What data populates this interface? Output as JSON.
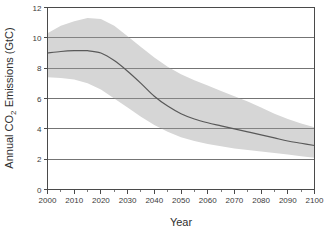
{
  "chart_data": {
    "type": "area",
    "title": "",
    "xlabel": "Year",
    "ylabel": "Annual CO2 Emissions (GtC)",
    "ylabel_parts": {
      "prefix": "Annual CO",
      "subscript": "2",
      "suffix": " Emissions (GtC)"
    },
    "xlim": [
      2000,
      2100
    ],
    "ylim": [
      0,
      12
    ],
    "grid": "horizontal",
    "legend": "none",
    "x_ticks": [
      2000,
      2010,
      2020,
      2030,
      2040,
      2050,
      2060,
      2070,
      2080,
      2090,
      2100
    ],
    "x_tick_labels": [
      "2000",
      "2010",
      "2020",
      "2030",
      "2040",
      "2050",
      "2060",
      "2070",
      "2080",
      "2090",
      "2100"
    ],
    "x_minor_tick_interval": 5,
    "y_ticks": [
      0,
      2,
      4,
      6,
      8,
      10,
      12
    ],
    "y_tick_labels": [
      "0",
      "2",
      "4",
      "6",
      "8",
      "10",
      "12"
    ],
    "x": [
      2000,
      2005,
      2010,
      2015,
      2020,
      2025,
      2030,
      2035,
      2040,
      2045,
      2050,
      2055,
      2060,
      2065,
      2070,
      2075,
      2080,
      2085,
      2090,
      2095,
      2100
    ],
    "series": [
      {
        "name": "Median emissions pathway",
        "role": "line",
        "color": "#595959",
        "values": [
          9.0,
          9.1,
          9.15,
          9.15,
          9.0,
          8.5,
          7.8,
          7.0,
          6.15,
          5.5,
          5.0,
          4.65,
          4.4,
          4.2,
          4.0,
          3.8,
          3.6,
          3.4,
          3.2,
          3.05,
          2.9
        ]
      },
      {
        "name": "Uncertainty range upper bound",
        "role": "band-upper",
        "color": "#d6d6d6",
        "values": [
          10.3,
          10.8,
          11.1,
          11.3,
          11.25,
          10.8,
          10.1,
          9.4,
          8.7,
          8.1,
          7.6,
          7.2,
          6.85,
          6.5,
          6.15,
          5.8,
          5.4,
          5.0,
          4.65,
          4.35,
          4.1
        ]
      },
      {
        "name": "Uncertainty range lower bound",
        "role": "band-lower",
        "color": "#d6d6d6",
        "values": [
          7.4,
          7.35,
          7.25,
          7.0,
          6.6,
          6.0,
          5.4,
          4.8,
          4.25,
          3.8,
          3.45,
          3.2,
          3.0,
          2.85,
          2.7,
          2.6,
          2.5,
          2.4,
          2.3,
          2.2,
          2.1
        ]
      }
    ]
  },
  "figure": {
    "background_color": "#ffffff",
    "band_color": "#d6d6d6",
    "line_color": "#595959",
    "axis_color": "#4a4a4a",
    "grid_color": "#6e6e6e"
  }
}
